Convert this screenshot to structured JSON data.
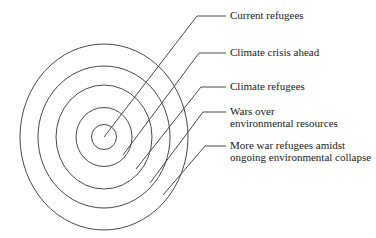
{
  "diagram": {
    "type": "concentric-circles",
    "rings": [
      {
        "id": 1,
        "position": "innermost",
        "label": "Current refugees",
        "lines": [
          "Current refugees"
        ]
      },
      {
        "id": 2,
        "position": "ring-2",
        "label": "Climate crisis ahead",
        "lines": [
          "Climate crisis ahead"
        ]
      },
      {
        "id": 3,
        "position": "ring-3",
        "label": "Climate refugees",
        "lines": [
          "Climate refugees"
        ]
      },
      {
        "id": 4,
        "position": "ring-4",
        "label": "Wars over environmental resources",
        "lines": [
          "Wars over",
          "environmental resources"
        ]
      },
      {
        "id": 5,
        "position": "outermost",
        "label": "More war refugees amidst ongoing environmental collapse",
        "lines": [
          "More war refugees amidst",
          "ongoing environmental collapse"
        ]
      }
    ],
    "colors": {
      "background": "#ffffff",
      "line": "#4a4a4a",
      "text": "#1b1b1b"
    }
  }
}
